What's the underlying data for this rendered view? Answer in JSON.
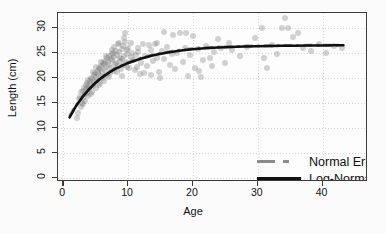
{
  "chart_data": {
    "type": "scatter",
    "title": "",
    "xlabel": "Age",
    "ylabel": "Length (cm)",
    "xlim": [
      -0.8,
      47
    ],
    "ylim": [
      -0.8,
      33
    ],
    "xticks": [
      0,
      10,
      20,
      30,
      40
    ],
    "yticks": [
      0,
      5,
      10,
      15,
      20,
      25,
      30
    ],
    "grid": true,
    "legend_position": "lower-right-inside",
    "legend": [
      {
        "name": "Normal Errors",
        "style": "dash-dot",
        "color": "#8c8c8c"
      },
      {
        "name": "Log-Normal Errors",
        "style": "solid",
        "color": "#111111"
      }
    ],
    "point_color": "#6e6e6e",
    "point_alpha": 0.3,
    "series": [
      {
        "name": "Normal Errors",
        "type": "line",
        "style": "dash-dot",
        "color": "#8c8c8c",
        "x": [
          1,
          2,
          3,
          4,
          5,
          6,
          7,
          8,
          9,
          10,
          12,
          14,
          16,
          18,
          20,
          22,
          24,
          26,
          28,
          30,
          32,
          34,
          36,
          38,
          40,
          42,
          43.5
        ],
        "y": [
          12.2,
          14.4,
          16.2,
          17.7,
          19.0,
          20.1,
          21.0,
          21.8,
          22.4,
          23.0,
          23.9,
          24.6,
          25.1,
          25.5,
          25.8,
          26.0,
          26.1,
          26.2,
          26.3,
          26.35,
          26.4,
          26.45,
          26.45,
          26.5,
          26.5,
          26.5,
          26.5
        ]
      },
      {
        "name": "Log-Normal Errors",
        "type": "line",
        "style": "solid",
        "color": "#111111",
        "x": [
          1,
          2,
          3,
          4,
          5,
          6,
          7,
          8,
          9,
          10,
          12,
          14,
          16,
          18,
          20,
          22,
          24,
          26,
          28,
          30,
          32,
          34,
          36,
          38,
          40,
          42,
          43.5
        ],
        "y": [
          12.0,
          14.3,
          16.1,
          17.6,
          18.9,
          20.0,
          20.9,
          21.7,
          22.3,
          22.9,
          23.8,
          24.5,
          25.0,
          25.4,
          25.7,
          25.9,
          26.05,
          26.15,
          26.25,
          26.3,
          26.35,
          26.4,
          26.4,
          26.45,
          26.45,
          26.5,
          26.5
        ]
      },
      {
        "name": "observations",
        "type": "scatter",
        "points": [
          [
            2.1,
            12.0
          ],
          [
            2.3,
            13.1
          ],
          [
            2.4,
            15.9
          ],
          [
            2.6,
            16.3
          ],
          [
            2.7,
            14.2
          ],
          [
            2.8,
            17.2
          ],
          [
            2.9,
            15.0
          ],
          [
            3.0,
            16.0
          ],
          [
            3.1,
            17.5
          ],
          [
            3.2,
            18.0
          ],
          [
            3.3,
            15.5
          ],
          [
            3.4,
            16.8
          ],
          [
            3.5,
            18.6
          ],
          [
            3.6,
            17.0
          ],
          [
            3.7,
            19.0
          ],
          [
            3.8,
            16.5
          ],
          [
            3.9,
            18.2
          ],
          [
            4.0,
            17.8
          ],
          [
            4.1,
            19.4
          ],
          [
            4.2,
            18.8
          ],
          [
            4.3,
            20.0
          ],
          [
            4.4,
            17.3
          ],
          [
            4.5,
            19.8
          ],
          [
            4.6,
            18.4
          ],
          [
            4.7,
            20.6
          ],
          [
            4.8,
            19.2
          ],
          [
            4.9,
            21.0
          ],
          [
            5.0,
            18.0
          ],
          [
            5.1,
            20.2
          ],
          [
            5.2,
            19.6
          ],
          [
            5.3,
            21.4
          ],
          [
            5.4,
            20.8
          ],
          [
            5.5,
            22.0
          ],
          [
            5.6,
            19.0
          ],
          [
            5.7,
            21.8
          ],
          [
            5.8,
            20.4
          ],
          [
            5.9,
            22.4
          ],
          [
            6.0,
            21.2
          ],
          [
            6.1,
            23.0
          ],
          [
            6.2,
            20.0
          ],
          [
            6.3,
            22.8
          ],
          [
            6.4,
            21.6
          ],
          [
            6.5,
            23.4
          ],
          [
            6.6,
            22.2
          ],
          [
            6.7,
            24.0
          ],
          [
            6.8,
            20.6
          ],
          [
            6.9,
            23.2
          ],
          [
            7.0,
            22.6
          ],
          [
            7.1,
            24.4
          ],
          [
            7.2,
            21.0
          ],
          [
            7.3,
            23.8
          ],
          [
            7.4,
            22.0
          ],
          [
            7.5,
            24.8
          ],
          [
            7.6,
            23.6
          ],
          [
            7.7,
            25.0
          ],
          [
            7.8,
            21.4
          ],
          [
            7.9,
            24.2
          ],
          [
            8.0,
            22.8
          ],
          [
            8.1,
            25.4
          ],
          [
            8.2,
            23.0
          ],
          [
            8.3,
            24.6
          ],
          [
            8.4,
            26.8
          ],
          [
            8.5,
            22.4
          ],
          [
            8.6,
            25.2
          ],
          [
            8.7,
            23.4
          ],
          [
            8.8,
            24.0
          ],
          [
            8.9,
            21.8
          ],
          [
            9.0,
            25.8
          ],
          [
            9.1,
            23.8
          ],
          [
            9.2,
            26.4
          ],
          [
            9.3,
            22.6
          ],
          [
            9.4,
            24.4
          ],
          [
            9.5,
            29.0
          ],
          [
            9.6,
            27.2
          ],
          [
            9.7,
            23.2
          ],
          [
            9.8,
            25.6
          ],
          [
            9.9,
            24.8
          ],
          [
            10.0,
            26.0
          ],
          [
            10.2,
            22.0
          ],
          [
            10.4,
            24.2
          ],
          [
            10.6,
            25.0
          ],
          [
            10.8,
            23.6
          ],
          [
            11.0,
            21.6
          ],
          [
            11.2,
            24.6
          ],
          [
            11.4,
            22.2
          ],
          [
            11.6,
            25.2
          ],
          [
            11.8,
            20.8
          ],
          [
            12.0,
            23.0
          ],
          [
            12.3,
            26.8
          ],
          [
            12.6,
            24.4
          ],
          [
            12.9,
            22.4
          ],
          [
            13.2,
            26.6
          ],
          [
            13.5,
            25.6
          ],
          [
            13.8,
            23.4
          ],
          [
            14.1,
            26.8
          ],
          [
            14.4,
            24.0
          ],
          [
            14.7,
            21.2
          ],
          [
            15.0,
            20.0
          ],
          [
            15.3,
            25.4
          ],
          [
            15.6,
            23.8
          ],
          [
            16.0,
            26.2
          ],
          [
            16.4,
            22.6
          ],
          [
            16.8,
            24.8
          ],
          [
            17.2,
            21.8
          ],
          [
            17.6,
            25.0
          ],
          [
            18.0,
            29.0
          ],
          [
            18.4,
            23.2
          ],
          [
            18.8,
            26.0
          ],
          [
            19.2,
            20.4
          ],
          [
            19.6,
            24.6
          ],
          [
            20.0,
            28.4
          ],
          [
            20.4,
            22.0
          ],
          [
            20.8,
            25.8
          ],
          [
            21.2,
            20.2
          ],
          [
            21.6,
            23.6
          ],
          [
            22.0,
            26.4
          ],
          [
            22.6,
            24.0
          ],
          [
            23.2,
            25.2
          ],
          [
            23.8,
            27.8
          ],
          [
            24.4,
            26.0
          ],
          [
            25.0,
            23.0
          ],
          [
            26.0,
            25.6
          ],
          [
            27.2,
            24.4
          ],
          [
            28.4,
            26.2
          ],
          [
            29.6,
            28.0
          ],
          [
            30.6,
            30.0
          ],
          [
            31.4,
            22.0
          ],
          [
            32.2,
            26.6
          ],
          [
            33.0,
            24.8
          ],
          [
            33.8,
            30.0
          ],
          [
            34.2,
            32.0
          ],
          [
            34.6,
            30.0
          ],
          [
            35.4,
            28.2
          ],
          [
            36.2,
            29.0
          ],
          [
            37.0,
            26.0
          ],
          [
            38.2,
            25.4
          ],
          [
            39.4,
            26.8
          ],
          [
            40.6,
            25.0
          ],
          [
            41.8,
            26.4
          ],
          [
            43.0,
            26.0
          ],
          [
            3.05,
            14.8
          ],
          [
            3.45,
            17.9
          ],
          [
            3.85,
            19.6
          ],
          [
            4.25,
            16.9
          ],
          [
            4.65,
            21.2
          ],
          [
            5.05,
            22.2
          ],
          [
            5.45,
            18.6
          ],
          [
            5.85,
            23.2
          ],
          [
            6.25,
            19.4
          ],
          [
            6.65,
            24.4
          ],
          [
            7.05,
            20.2
          ],
          [
            7.45,
            25.6
          ],
          [
            7.85,
            26.2
          ],
          [
            8.25,
            21.2
          ],
          [
            8.65,
            27.0
          ],
          [
            9.05,
            20.4
          ],
          [
            9.45,
            28.0
          ],
          [
            9.85,
            22.2
          ],
          [
            10.5,
            27.0
          ],
          [
            11.5,
            26.0
          ],
          [
            12.5,
            21.0
          ],
          [
            13.5,
            20.6
          ],
          [
            14.5,
            27.0
          ],
          [
            15.5,
            29.2
          ],
          [
            17.0,
            28.6
          ],
          [
            19.0,
            29.0
          ],
          [
            21.0,
            21.4
          ],
          [
            23.0,
            22.4
          ],
          [
            25.5,
            27.0
          ],
          [
            31.0,
            24.0
          ]
        ]
      }
    ]
  }
}
